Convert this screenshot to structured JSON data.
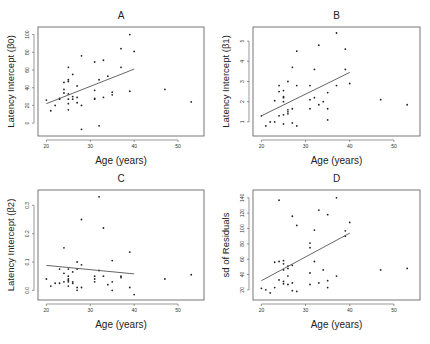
{
  "chart_data": [
    {
      "panel": "A",
      "type": "scatter",
      "title": "A",
      "xlabel": "Age (years)",
      "ylabel": "Latency Intercept  (β0)",
      "xlim": [
        19,
        55
      ],
      "ylim": [
        -10,
        104
      ],
      "xticks": [
        20,
        30,
        40,
        50
      ],
      "yticks": [
        0,
        20,
        40,
        60,
        80,
        100
      ],
      "grid": false,
      "points": [
        [
          20,
          26
        ],
        [
          21,
          14
        ],
        [
          22,
          20
        ],
        [
          23,
          28
        ],
        [
          23,
          27
        ],
        [
          24,
          46
        ],
        [
          24,
          38
        ],
        [
          24,
          34
        ],
        [
          25,
          63
        ],
        [
          25,
          49
        ],
        [
          25,
          47
        ],
        [
          25,
          33
        ],
        [
          25,
          27
        ],
        [
          25,
          22
        ],
        [
          25,
          15
        ],
        [
          26,
          55
        ],
        [
          26,
          30
        ],
        [
          26,
          27
        ],
        [
          27,
          42
        ],
        [
          27,
          29
        ],
        [
          27,
          23
        ],
        [
          28,
          76
        ],
        [
          28,
          20
        ],
        [
          28,
          -7
        ],
        [
          31,
          69
        ],
        [
          31,
          37
        ],
        [
          31,
          28
        ],
        [
          31,
          27
        ],
        [
          32,
          -3
        ],
        [
          32,
          49
        ],
        [
          33,
          71
        ],
        [
          33,
          29
        ],
        [
          34,
          53
        ],
        [
          35,
          35
        ],
        [
          35,
          32
        ],
        [
          37,
          84
        ],
        [
          37,
          63
        ],
        [
          39,
          100
        ],
        [
          39,
          36
        ],
        [
          40,
          81
        ],
        [
          47,
          38
        ],
        [
          53,
          24
        ]
      ],
      "fit_line": {
        "x": [
          20,
          40
        ],
        "y": [
          22,
          61
        ]
      }
    },
    {
      "panel": "B",
      "type": "scatter",
      "title": "B",
      "xlabel": "Age (years)",
      "ylabel": "Latency Intercept  (β1)",
      "xlim": [
        19,
        55
      ],
      "ylim": [
        0.5,
        5.5
      ],
      "xticks": [
        20,
        30,
        40,
        50
      ],
      "yticks": [
        1,
        2,
        3,
        4,
        5
      ],
      "grid": false,
      "points": [
        [
          20,
          1.3
        ],
        [
          21,
          0.8
        ],
        [
          22,
          1.0
        ],
        [
          23,
          1.0
        ],
        [
          23,
          2.05
        ],
        [
          24,
          1.3
        ],
        [
          24,
          2.8
        ],
        [
          24,
          2.5
        ],
        [
          25,
          1.35
        ],
        [
          25,
          0.9
        ],
        [
          25,
          2.2
        ],
        [
          25,
          2.55
        ],
        [
          25,
          2.25
        ],
        [
          25,
          2.0
        ],
        [
          26,
          1.6
        ],
        [
          26,
          1.5
        ],
        [
          26,
          1.4
        ],
        [
          26,
          3.0
        ],
        [
          27,
          3.7
        ],
        [
          27,
          1.65
        ],
        [
          27,
          0.95
        ],
        [
          28,
          4.5
        ],
        [
          28,
          2.8
        ],
        [
          28,
          0.8
        ],
        [
          31,
          2.8
        ],
        [
          31,
          2.1
        ],
        [
          31,
          1.65
        ],
        [
          32,
          3.6
        ],
        [
          32,
          2.2
        ],
        [
          33,
          4.8
        ],
        [
          33,
          1.85
        ],
        [
          34,
          2.0
        ],
        [
          35,
          2.45
        ],
        [
          35,
          1.65
        ],
        [
          35,
          1.1
        ],
        [
          37,
          5.4
        ],
        [
          37,
          2.8
        ],
        [
          39,
          4.6
        ],
        [
          39,
          3.6
        ],
        [
          40,
          2.9
        ],
        [
          47,
          2.1
        ],
        [
          53,
          1.85
        ]
      ],
      "fit_line": {
        "x": [
          20,
          40
        ],
        "y": [
          1.3,
          3.45
        ]
      }
    },
    {
      "panel": "C",
      "type": "scatter",
      "title": "C",
      "xlabel": "Age (years)",
      "ylabel": "Latency Intercept  (β2)",
      "xlim": [
        19,
        55
      ],
      "ylim": [
        -0.02,
        0.34
      ],
      "xticks": [
        20,
        30,
        40,
        50
      ],
      "yticks": [
        0.0,
        0.1,
        0.2,
        0.3
      ],
      "grid": false,
      "points": [
        [
          20,
          0.04
        ],
        [
          21,
          0.015
        ],
        [
          22,
          0.025
        ],
        [
          23,
          0.025
        ],
        [
          23,
          0.075
        ],
        [
          24,
          0.03
        ],
        [
          24,
          0.06
        ],
        [
          24,
          0.15
        ],
        [
          25,
          0.075
        ],
        [
          25,
          0.05
        ],
        [
          25,
          0.04
        ],
        [
          25,
          0.035
        ],
        [
          25,
          0.03
        ],
        [
          25,
          0.015
        ],
        [
          26,
          0.065
        ],
        [
          26,
          0.03
        ],
        [
          26,
          0.025
        ],
        [
          27,
          0.1
        ],
        [
          27,
          0.075
        ],
        [
          27,
          0.01
        ],
        [
          27,
          0.0
        ],
        [
          28,
          0.25
        ],
        [
          28,
          0.09
        ],
        [
          28,
          0.01
        ],
        [
          31,
          0.05
        ],
        [
          31,
          0.04
        ],
        [
          31,
          0.03
        ],
        [
          32,
          0.33
        ],
        [
          32,
          0.07
        ],
        [
          33,
          0.22
        ],
        [
          33,
          0.05
        ],
        [
          34,
          0.02
        ],
        [
          35,
          0.105
        ],
        [
          35,
          0.03
        ],
        [
          35,
          0.0
        ],
        [
          37,
          0.05
        ],
        [
          37,
          0.045
        ],
        [
          39,
          0.135
        ],
        [
          39,
          0.01
        ],
        [
          40,
          -0.015
        ],
        [
          47,
          0.04
        ],
        [
          53,
          0.055
        ]
      ],
      "fit_line": {
        "x": [
          20,
          40
        ],
        "y": [
          0.088,
          0.058
        ]
      }
    },
    {
      "panel": "D",
      "type": "scatter",
      "title": "D",
      "xlabel": "Age (years)",
      "ylabel": "sd of Residuals",
      "xlim": [
        19,
        55
      ],
      "ylim": [
        12,
        145
      ],
      "xticks": [
        20,
        30,
        40,
        50
      ],
      "yticks": [
        20,
        40,
        60,
        80,
        100,
        120,
        140
      ],
      "grid": false,
      "points": [
        [
          20,
          22
        ],
        [
          21,
          20
        ],
        [
          22,
          16
        ],
        [
          23,
          23
        ],
        [
          23,
          56
        ],
        [
          24,
          57
        ],
        [
          24,
          33
        ],
        [
          24,
          137
        ],
        [
          25,
          58
        ],
        [
          25,
          54
        ],
        [
          25,
          46
        ],
        [
          25,
          31
        ],
        [
          25,
          28
        ],
        [
          26,
          51
        ],
        [
          26,
          48
        ],
        [
          26,
          38
        ],
        [
          26,
          27
        ],
        [
          27,
          52
        ],
        [
          27,
          29
        ],
        [
          27,
          19
        ],
        [
          27,
          116
        ],
        [
          28,
          104
        ],
        [
          28,
          18
        ],
        [
          31,
          81
        ],
        [
          31,
          75
        ],
        [
          31,
          42
        ],
        [
          31,
          27
        ],
        [
          32,
          98
        ],
        [
          32,
          57
        ],
        [
          33,
          124
        ],
        [
          33,
          29
        ],
        [
          34,
          46
        ],
        [
          35,
          118
        ],
        [
          35,
          32
        ],
        [
          35,
          23
        ],
        [
          37,
          140
        ],
        [
          37,
          38
        ],
        [
          39,
          97
        ],
        [
          39,
          90
        ],
        [
          40,
          108
        ],
        [
          47,
          46
        ],
        [
          53,
          48
        ]
      ],
      "fit_line": {
        "x": [
          20,
          40
        ],
        "y": [
          32,
          94
        ]
      }
    }
  ]
}
